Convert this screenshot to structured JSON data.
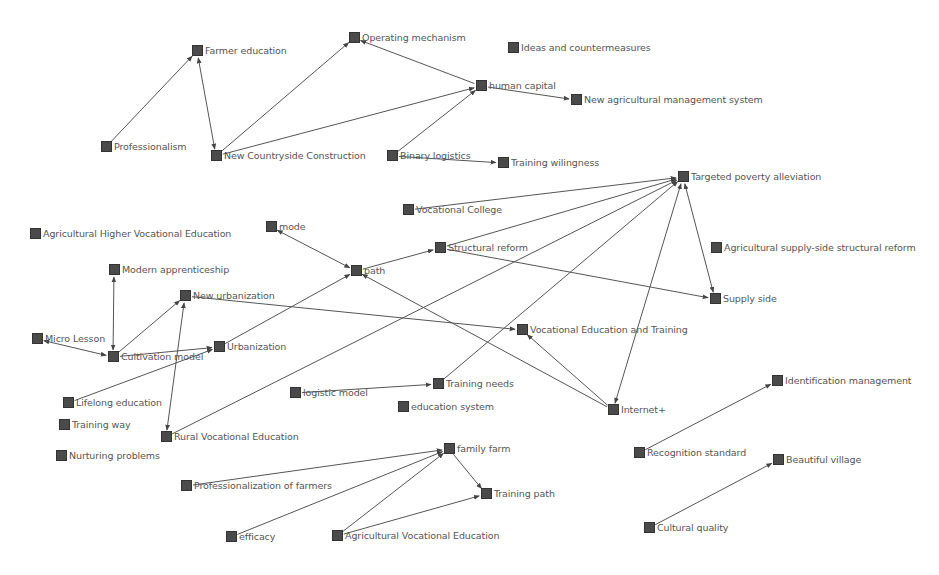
{
  "diagram": {
    "type": "directed-network-graph",
    "node_color": "#4a4a4a",
    "edge_color": "#555555",
    "label_color": "#555555",
    "nodes": [
      {
        "id": "farmer_education",
        "label": "Farmer education",
        "x": 197,
        "y": 51
      },
      {
        "id": "operating_mechanism",
        "label": "Operating mechanism",
        "x": 354,
        "y": 38
      },
      {
        "id": "ideas_countermeasures",
        "label": "Ideas and countermeasures",
        "x": 513,
        "y": 48
      },
      {
        "id": "human_capital",
        "label": "human capital",
        "x": 481,
        "y": 86
      },
      {
        "id": "new_agri_mgmt",
        "label": "New agricultural management system",
        "x": 576,
        "y": 100
      },
      {
        "id": "professionalism",
        "label": "Professionalism",
        "x": 106,
        "y": 147
      },
      {
        "id": "new_countryside",
        "label": "New Countryside Construction",
        "x": 216,
        "y": 156
      },
      {
        "id": "binary_logistics",
        "label": "Binary logistics",
        "x": 392,
        "y": 156
      },
      {
        "id": "training_willingness",
        "label": "Training wilingness",
        "x": 503,
        "y": 163
      },
      {
        "id": "targeted_poverty",
        "label": "Targeted poverty alleviation",
        "x": 683,
        "y": 177
      },
      {
        "id": "vocational_college",
        "label": "Vocational College",
        "x": 408,
        "y": 210
      },
      {
        "id": "mode",
        "label": "mode",
        "x": 271,
        "y": 227
      },
      {
        "id": "agri_higher_voc",
        "label": "Agricultural Higher Vocational Education",
        "x": 35,
        "y": 234
      },
      {
        "id": "structural_reform",
        "label": "Structural reform",
        "x": 440,
        "y": 248
      },
      {
        "id": "agri_supply_side",
        "label": "Agricultural supply-side structural reform",
        "x": 716,
        "y": 248
      },
      {
        "id": "modern_apprenticeship",
        "label": "Modern apprenticeship",
        "x": 114,
        "y": 270
      },
      {
        "id": "path",
        "label": "path",
        "x": 356,
        "y": 271
      },
      {
        "id": "new_urbanization",
        "label": "New urbanization",
        "x": 185,
        "y": 296
      },
      {
        "id": "supply_side",
        "label": "Supply side",
        "x": 715,
        "y": 299
      },
      {
        "id": "vet",
        "label": "Vocational Education and Training",
        "x": 522,
        "y": 330
      },
      {
        "id": "micro_lesson",
        "label": "Micro Lesson",
        "x": 37,
        "y": 339
      },
      {
        "id": "urbanization",
        "label": "Urbanization",
        "x": 219,
        "y": 347
      },
      {
        "id": "cultivation_model",
        "label": "Cultivation model",
        "x": 113,
        "y": 357
      },
      {
        "id": "identification_mgmt",
        "label": "Identification management",
        "x": 777,
        "y": 381
      },
      {
        "id": "logistic_model",
        "label": "logistic model",
        "x": 295,
        "y": 393
      },
      {
        "id": "training_needs",
        "label": "Training needs",
        "x": 438,
        "y": 384
      },
      {
        "id": "lifelong_education",
        "label": "Lifelong education",
        "x": 68,
        "y": 403
      },
      {
        "id": "education_system",
        "label": "education system",
        "x": 403,
        "y": 407
      },
      {
        "id": "internet_plus",
        "label": "Internet+",
        "x": 613,
        "y": 410
      },
      {
        "id": "training_way",
        "label": "Training way",
        "x": 64,
        "y": 425
      },
      {
        "id": "rural_voc_edu",
        "label": "Rural Vocational Education",
        "x": 166,
        "y": 437
      },
      {
        "id": "nurturing_problems",
        "label": "Nurturing problems",
        "x": 61,
        "y": 456
      },
      {
        "id": "family_farm",
        "label": "family farm",
        "x": 449,
        "y": 449
      },
      {
        "id": "recognition_standard",
        "label": "Recognition standard",
        "x": 639,
        "y": 453
      },
      {
        "id": "beautiful_village",
        "label": "Beautiful village",
        "x": 778,
        "y": 460
      },
      {
        "id": "prof_farmers",
        "label": "Professionalization of farmers",
        "x": 186,
        "y": 486
      },
      {
        "id": "training_path",
        "label": "Training path",
        "x": 486,
        "y": 494
      },
      {
        "id": "cultural_quality",
        "label": "Cultural quality",
        "x": 649,
        "y": 528
      },
      {
        "id": "efficacy",
        "label": "efficacy",
        "x": 231,
        "y": 537
      },
      {
        "id": "agri_voc_edu",
        "label": "Agricultural Vocational Education",
        "x": 337,
        "y": 536
      }
    ],
    "edges": [
      {
        "from": "professionalism",
        "to": "farmer_education"
      },
      {
        "from": "farmer_education",
        "to": "new_countryside",
        "bidirectional": true
      },
      {
        "from": "new_countryside",
        "to": "operating_mechanism"
      },
      {
        "from": "new_countryside",
        "to": "human_capital"
      },
      {
        "from": "human_capital",
        "to": "operating_mechanism"
      },
      {
        "from": "binary_logistics",
        "to": "human_capital"
      },
      {
        "from": "human_capital",
        "to": "new_agri_mgmt"
      },
      {
        "from": "binary_logistics",
        "to": "training_willingness"
      },
      {
        "from": "vocational_college",
        "to": "targeted_poverty"
      },
      {
        "from": "structural_reform",
        "to": "targeted_poverty"
      },
      {
        "from": "path",
        "to": "structural_reform"
      },
      {
        "from": "structural_reform",
        "to": "supply_side"
      },
      {
        "from": "targeted_poverty",
        "to": "supply_side",
        "bidirectional": true
      },
      {
        "from": "rural_voc_edu",
        "to": "targeted_poverty"
      },
      {
        "from": "training_needs",
        "to": "targeted_poverty"
      },
      {
        "from": "internet_plus",
        "to": "targeted_poverty",
        "bidirectional": true
      },
      {
        "from": "mode",
        "to": "path",
        "bidirectional": true
      },
      {
        "from": "urbanization",
        "to": "path"
      },
      {
        "from": "internet_plus",
        "to": "path"
      },
      {
        "from": "new_urbanization",
        "to": "vet"
      },
      {
        "from": "internet_plus",
        "to": "vet"
      },
      {
        "from": "modern_apprenticeship",
        "to": "cultivation_model",
        "bidirectional": true
      },
      {
        "from": "micro_lesson",
        "to": "cultivation_model",
        "bidirectional": true
      },
      {
        "from": "cultivation_model",
        "to": "new_urbanization"
      },
      {
        "from": "cultivation_model",
        "to": "urbanization"
      },
      {
        "from": "lifelong_education",
        "to": "urbanization"
      },
      {
        "from": "new_urbanization",
        "to": "rural_voc_edu",
        "bidirectional": true
      },
      {
        "from": "logistic_model",
        "to": "training_needs"
      },
      {
        "from": "recognition_standard",
        "to": "identification_mgmt"
      },
      {
        "from": "cultural_quality",
        "to": "beautiful_village"
      },
      {
        "from": "prof_farmers",
        "to": "family_farm"
      },
      {
        "from": "efficacy",
        "to": "family_farm"
      },
      {
        "from": "agri_voc_edu",
        "to": "family_farm"
      },
      {
        "from": "family_farm",
        "to": "training_path"
      },
      {
        "from": "agri_voc_edu",
        "to": "training_path"
      }
    ]
  }
}
